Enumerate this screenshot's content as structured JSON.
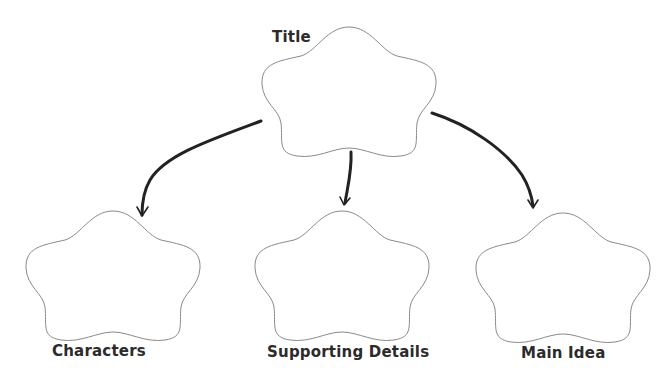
{
  "diagram": {
    "type": "graphic-organizer",
    "nodes": [
      {
        "id": "title",
        "label": "Title"
      },
      {
        "id": "characters",
        "label": "Characters"
      },
      {
        "id": "supporting",
        "label": "Supporting Details"
      },
      {
        "id": "main",
        "label": "Main Idea"
      }
    ],
    "edges": [
      {
        "from": "title",
        "to": "characters"
      },
      {
        "from": "title",
        "to": "supporting"
      },
      {
        "from": "title",
        "to": "main"
      }
    ],
    "colors": {
      "outline": "#8a8a8a",
      "arrow": "#222222",
      "text": "#2b2b2b"
    }
  }
}
